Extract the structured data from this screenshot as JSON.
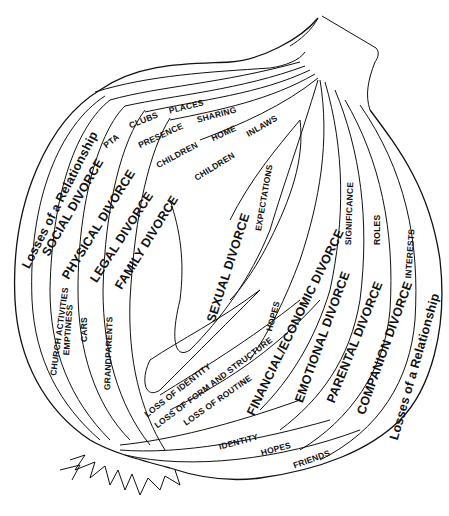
{
  "diagram": {
    "type": "onion-layers",
    "outer_layers_left": [
      {
        "label": "Losses of a Relationship"
      },
      {
        "label": "SOCIAL DIVORCE",
        "items": [
          "CHURCH ACTIVITIES",
          "PTA",
          "CLUBS",
          "PLACES"
        ]
      },
      {
        "label": "PHYSICAL DIVORCE",
        "items": [
          "EMPTINESS",
          "PRESENCE",
          "SHARING"
        ]
      },
      {
        "label": "LEGAL DIVORCE",
        "items": [
          "CARS",
          "CHILDREN",
          "HOME"
        ]
      },
      {
        "label": "FAMILY DIVORCE",
        "items": [
          "GRANDPARENTS",
          "CHILDREN",
          "INLAWS"
        ]
      }
    ],
    "core": [
      {
        "label": "SEXUAL DIVORCE",
        "items": [
          "EXPECTATIONS"
        ]
      },
      {
        "label": "LOSS OF IDENTITY"
      },
      {
        "label": "LOSS OF FORM AND STRUCTURE"
      },
      {
        "label": "LOSS OF ROUTINE"
      }
    ],
    "outer_layers_right": [
      {
        "label": "FINANCIAL/ECONOMIC DIVORCE",
        "items": [
          "HOPES"
        ]
      },
      {
        "label": "EMOTIONAL DIVORCE",
        "items": [
          "SIGNIFICANCE",
          "IDENTITY"
        ]
      },
      {
        "label": "PARENTAL DIVORCE",
        "items": [
          "ROLES",
          "HOPES"
        ]
      },
      {
        "label": "COMPANION DIVORCE",
        "items": [
          "INTERESTS",
          "FRIENDS"
        ]
      },
      {
        "label": "Losses of a Relationship"
      }
    ],
    "labels": {
      "losses_left": "Losses of a Relationship",
      "social": "SOCIAL DIVORCE",
      "physical": "PHYSICAL DIVORCE",
      "legal": "LEGAL DIVORCE",
      "family": "FAMILY DIVORCE",
      "sexual": "SEXUAL DIVORCE",
      "financial": "FINANCIAL/ECONOMIC DIVORCE",
      "emotional": "EMOTIONAL DIVORCE",
      "parental": "PARENTAL DIVORCE",
      "companion": "COMPANION DIVORCE",
      "losses_right": "Losses of a Relationship",
      "pta": "PTA",
      "clubs": "CLUBS",
      "places": "PLACES",
      "presence": "PRESENCE",
      "sharing": "SHARING",
      "children1": "CHILDREN",
      "home": "HOME",
      "children2": "CHILDREN",
      "inlaws": "INLAWS",
      "church": "CHURCH ACTIVITIES",
      "emptiness": "EMPTINESS",
      "cars": "CARS",
      "grandparents": "GRANDPARENTS",
      "expectations": "EXPECTATIONS",
      "significance": "SIGNIFICANCE",
      "roles": "ROLES",
      "interests": "INTERESTS",
      "hopes_core": "HOPES",
      "loss_identity": "LOSS OF IDENTITY",
      "loss_form": "LOSS OF FORM AND STRUCTURE",
      "loss_routine": "LOSS OF ROUTINE",
      "identity": "IDENTITY",
      "hopes_bottom": "HOPES",
      "friends": "FRIENDS"
    }
  }
}
